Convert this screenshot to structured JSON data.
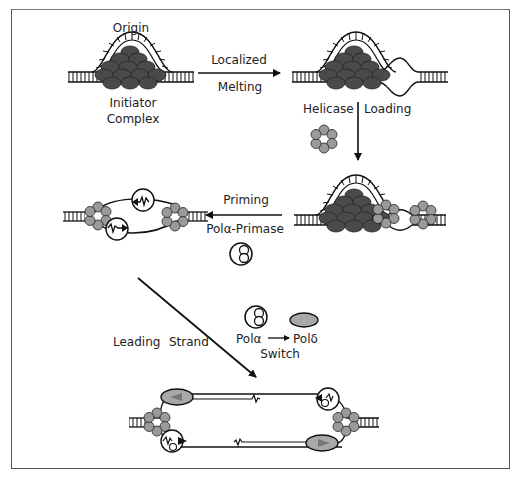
{
  "diagram": {
    "colors": {
      "initiator": "#4a4a4a",
      "helicase": "#9a9a9a",
      "pol_delta": "#a8a8a8",
      "line": "#111111",
      "frame": "#555555"
    },
    "labels": {
      "origin": "Origin",
      "initiator_1": "Initiator",
      "initiator_2": "Complex",
      "localized": "Localized",
      "melting": "Melting",
      "helicase": "Helicase",
      "loading": "Loading",
      "priming": "Priming",
      "pol_primase": "Polα-Primase",
      "leading": "Leading",
      "strand": "Strand",
      "pol_alpha": "Polα",
      "pol_delta": "Polδ",
      "switch": "Switch"
    },
    "steps": [
      {
        "from": "Initiator complex at origin",
        "to": "Localized melting",
        "arrow": "right"
      },
      {
        "from": "Melted origin",
        "to": "Helicase loading",
        "arrow": "down"
      },
      {
        "from": "Helicase loaded",
        "to": "Priming by Polα-Primase",
        "arrow": "left"
      },
      {
        "from": "Primed forks",
        "to": "Leading strand with Polα→Polδ switch",
        "arrow": "diagonal"
      }
    ]
  }
}
